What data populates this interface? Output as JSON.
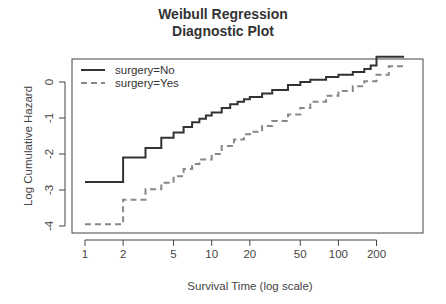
{
  "chart_data": {
    "type": "line",
    "title_lines": [
      "Weibull Regression",
      "Diagnostic Plot"
    ],
    "xlabel": "Survival Time (log scale)",
    "ylabel": "Log Cumulative Hazard",
    "xscale": "log",
    "xticks": [
      1,
      2,
      5,
      10,
      20,
      50,
      100,
      200
    ],
    "yticks": [
      0,
      -1,
      -2,
      -3,
      -4
    ],
    "xlim": [
      0.85,
      400
    ],
    "ylim": [
      -4.2,
      0.65
    ],
    "grid": false,
    "legend_position": "top-left",
    "legend": [
      "surgery=No",
      "surgery=Yes"
    ],
    "step": true,
    "series": [
      {
        "name": "surgery=No",
        "style": "solid",
        "color": "#333333",
        "x": [
          1,
          2,
          3,
          4,
          5,
          6,
          7,
          8,
          9,
          10,
          12,
          14,
          16,
          18,
          20,
          25,
          30,
          40,
          50,
          60,
          80,
          100,
          130,
          160,
          180,
          200,
          330
        ],
        "y": [
          -2.78,
          -2.1,
          -1.83,
          -1.55,
          -1.4,
          -1.25,
          -1.12,
          -1.02,
          -0.93,
          -0.85,
          -0.72,
          -0.62,
          -0.55,
          -0.48,
          -0.42,
          -0.32,
          -0.22,
          -0.08,
          0.0,
          0.06,
          0.14,
          0.2,
          0.28,
          0.36,
          0.46,
          0.7,
          0.7
        ]
      },
      {
        "name": "surgery=Yes",
        "style": "dashed",
        "color": "#888888",
        "x": [
          1,
          2,
          3,
          4,
          5,
          6,
          7,
          8,
          10,
          12,
          15,
          18,
          20,
          25,
          30,
          40,
          50,
          60,
          80,
          100,
          130,
          160,
          200,
          250,
          330
        ],
        "y": [
          -3.95,
          -3.27,
          -2.98,
          -2.8,
          -2.62,
          -2.42,
          -2.28,
          -2.15,
          -2.0,
          -1.78,
          -1.6,
          -1.45,
          -1.38,
          -1.22,
          -1.08,
          -0.9,
          -0.72,
          -0.55,
          -0.38,
          -0.25,
          -0.12,
          0.02,
          0.2,
          0.44,
          0.44
        ]
      }
    ]
  }
}
